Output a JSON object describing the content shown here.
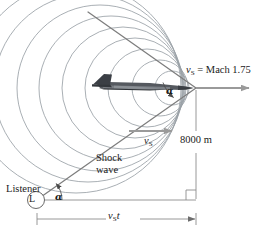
{
  "figure": {
    "background_color": "#ffffff",
    "width": 256,
    "height": 239
  },
  "labels": {
    "source_velocity": {
      "symbol": "v",
      "subscript": "S",
      "equals": " = Mach 1.75",
      "full_text": "vS = Mach 1.75"
    },
    "altitude": "8000 m",
    "shock_wave_line1": "Shock",
    "shock_wave_line2": "wave",
    "listener": "Listener",
    "listener_marker": "L",
    "velocity_mid": {
      "symbol": "v",
      "subscript": "S"
    },
    "distance": {
      "symbol": "v",
      "subscript": "S",
      "suffix": "t",
      "full_text": "vS t"
    },
    "angle_apex": "α",
    "angle_listener": "α"
  },
  "colors": {
    "wave_circle": "#9aa0a6",
    "cone_line": "#8d8d8d",
    "arrow": "#9a9a9a",
    "text": "#1a1a1a",
    "aircraft_dark": "#3b3f45",
    "aircraft_mid": "#6e7379",
    "aircraft_light": "#b9bdc2",
    "dimension_line": "#8d8d8d",
    "right_angle": "#8d8d8d"
  },
  "physics": {
    "mach_number": 1.75,
    "altitude_meters": 8000,
    "mach_angle_symbol": "α",
    "wavefront_count": 9
  },
  "geometry": {
    "apex_x": 196,
    "apex_y": 88,
    "listener_x": 36,
    "listener_y": 200,
    "ground_corner_x": 196,
    "ground_corner_y": 200
  }
}
